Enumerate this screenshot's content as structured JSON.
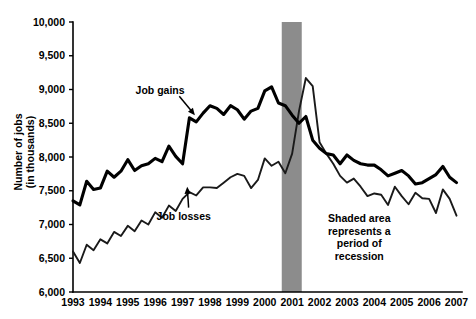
{
  "chart_data": {
    "type": "line",
    "title": "",
    "xlabel": "",
    "ylabel": "Number of jobs\n(in thousands)",
    "ylabel_line1": "Number of jobs",
    "ylabel_line2": "(in thousands)",
    "xlim": [
      1993.0,
      2007.2
    ],
    "ylim": [
      6000,
      10000
    ],
    "grid": false,
    "legend_position": "inline-annotations",
    "y_ticks": [
      6000,
      6500,
      7000,
      7500,
      8000,
      8500,
      9000,
      9500,
      10000
    ],
    "y_tick_labels": [
      "6,000",
      "6,500",
      "7,000",
      "7,500",
      "8,000",
      "8,500",
      "9,000",
      "9,500",
      "10,000"
    ],
    "x_ticks": [
      1993,
      1994,
      1995,
      1996,
      1997,
      1998,
      1999,
      2000,
      2001,
      2002,
      2003,
      2004,
      2005,
      2006,
      2007
    ],
    "x_tick_labels": [
      "1993",
      "1994",
      "1995",
      "1996",
      "1997",
      "1998",
      "1999",
      "2000",
      "2001",
      "2002",
      "2003",
      "2004",
      "2005",
      "2006",
      "2007"
    ],
    "shaded_regions": [
      {
        "name": "recession",
        "x_start": 2000.62,
        "x_end": 2001.35,
        "color": "#8c8c8c",
        "label": "Shaded area represents a period of recession"
      }
    ],
    "annotations": [
      {
        "name": "job-gains-label",
        "text": "Job gains",
        "x": 1996.6,
        "y": 8980,
        "arrow_to_x": 1997.45,
        "arrow_to_y": 8620
      },
      {
        "name": "job-losses-label",
        "text": "Job losses",
        "x": 1997.0,
        "y": 7120,
        "arrow_to_x": 1996.95,
        "arrow_to_y": 7560
      },
      {
        "name": "recession-note",
        "lines": [
          "Shaded area",
          "represents a",
          "period of",
          "recession"
        ],
        "x": 2003.45,
        "y": 7030
      }
    ],
    "series": [
      {
        "name": "Job gains",
        "color": "#000000",
        "line_width": 3.1,
        "x": [
          1993.0,
          1993.25,
          1993.5,
          1993.75,
          1994.0,
          1994.25,
          1994.5,
          1994.75,
          1995.0,
          1995.25,
          1995.5,
          1995.75,
          1996.0,
          1996.25,
          1996.5,
          1996.75,
          1997.0,
          1997.25,
          1997.5,
          1997.75,
          1998.0,
          1998.25,
          1998.5,
          1998.75,
          1999.0,
          1999.25,
          1999.5,
          1999.75,
          2000.0,
          2000.25,
          2000.5,
          2000.75,
          2001.0,
          2001.25,
          2001.5,
          2001.75,
          2002.0,
          2002.25,
          2002.5,
          2002.75,
          2003.0,
          2003.25,
          2003.5,
          2003.75,
          2004.0,
          2004.25,
          2004.5,
          2004.75,
          2005.0,
          2005.25,
          2005.5,
          2005.75,
          2006.0,
          2006.25,
          2006.5,
          2006.75,
          2007.0
        ],
        "values": [
          7350,
          7290,
          7640,
          7520,
          7540,
          7790,
          7700,
          7790,
          7960,
          7800,
          7870,
          7900,
          7980,
          7930,
          8160,
          8010,
          7900,
          8580,
          8520,
          8650,
          8760,
          8720,
          8630,
          8760,
          8700,
          8560,
          8680,
          8720,
          8980,
          9040,
          8800,
          8760,
          8620,
          8500,
          8600,
          8250,
          8130,
          8050,
          8030,
          7900,
          8030,
          7950,
          7900,
          7880,
          7880,
          7810,
          7720,
          7760,
          7800,
          7720,
          7600,
          7620,
          7680,
          7740,
          7860,
          7700,
          7620
        ]
      },
      {
        "name": "Job losses",
        "color": "#1a1a1a",
        "line_width": 1.9,
        "x": [
          1993.0,
          1993.25,
          1993.5,
          1993.75,
          1994.0,
          1994.25,
          1994.5,
          1994.75,
          1995.0,
          1995.25,
          1995.5,
          1995.75,
          1996.0,
          1996.25,
          1996.5,
          1996.75,
          1997.0,
          1997.25,
          1997.5,
          1997.75,
          1998.0,
          1998.25,
          1998.5,
          1998.75,
          1999.0,
          1999.25,
          1999.5,
          1999.75,
          2000.0,
          2000.25,
          2000.5,
          2000.75,
          2001.0,
          2001.25,
          2001.5,
          2001.75,
          2002.0,
          2002.25,
          2002.5,
          2002.75,
          2003.0,
          2003.25,
          2003.5,
          2003.75,
          2004.0,
          2004.25,
          2004.5,
          2004.75,
          2005.0,
          2005.25,
          2005.5,
          2005.75,
          2006.0,
          2006.25,
          2006.5,
          2006.75,
          2007.0
        ],
        "values": [
          6600,
          6430,
          6700,
          6620,
          6780,
          6720,
          6890,
          6830,
          6980,
          6900,
          7060,
          7000,
          7180,
          7100,
          7280,
          7200,
          7380,
          7480,
          7430,
          7550,
          7550,
          7540,
          7620,
          7700,
          7750,
          7720,
          7540,
          7660,
          7980,
          7870,
          7930,
          7760,
          8050,
          8680,
          9170,
          9050,
          8220,
          8050,
          7900,
          7720,
          7620,
          7680,
          7560,
          7420,
          7460,
          7440,
          7290,
          7560,
          7420,
          7300,
          7470,
          7390,
          7380,
          7170,
          7520,
          7380,
          7130
        ]
      }
    ]
  }
}
